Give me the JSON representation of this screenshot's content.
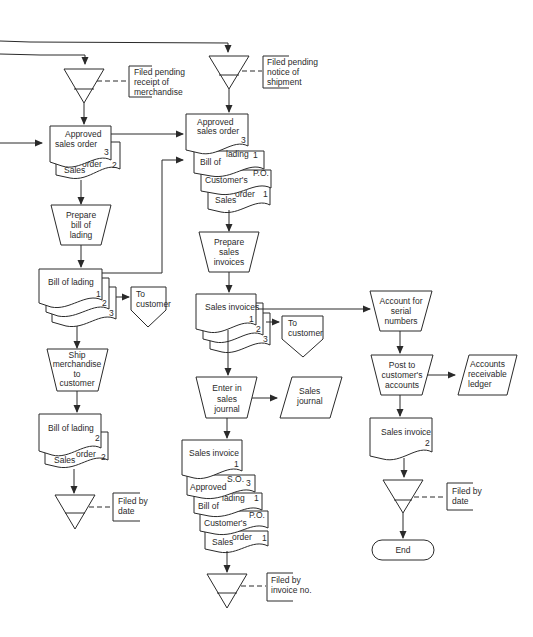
{
  "diagram": {
    "type": "document-flowchart",
    "colors": {
      "line": "#2a2a2a",
      "background": "#ffffff"
    },
    "nodes": {
      "file_pending_merchandise": {
        "shape": "offline-file",
        "annotation": [
          "Filed pending",
          "receipt of",
          "merchandise"
        ]
      },
      "file_pending_shipment": {
        "shape": "offline-file",
        "annotation": [
          "Filed pending",
          "notice of",
          "shipment"
        ]
      },
      "left_doc_stack_1": {
        "shape": "document-stack",
        "pages": [
          {
            "title": [
              "Approved",
              "sales order"
            ],
            "copy": "3"
          },
          {
            "title_a": "Sales",
            "title_b": "order",
            "copy": "2"
          }
        ]
      },
      "prepare_bol": {
        "shape": "manual-operation",
        "label": [
          "Prepare",
          "bill of",
          "lading"
        ]
      },
      "bol_stack": {
        "shape": "document-stack",
        "pages": [
          {
            "title": "Bill of lading",
            "copy": "1"
          },
          {
            "copy": "2"
          },
          {
            "copy": "3"
          }
        ]
      },
      "to_customer_1": {
        "shape": "off-page-connector",
        "label": [
          "To",
          "customer"
        ]
      },
      "ship_merchandise": {
        "shape": "manual-operation",
        "label": [
          "Ship",
          "merchandise",
          "to",
          "customer"
        ]
      },
      "left_doc_stack_2": {
        "shape": "document-stack",
        "pages": [
          {
            "title": "Bill of lading",
            "copy": "2"
          },
          {
            "title_a": "Sales",
            "title_b": "order",
            "copy": "2"
          }
        ]
      },
      "file_by_date_left": {
        "shape": "offline-file",
        "annotation": [
          "Filed by",
          "date"
        ]
      },
      "middle_doc_stack_1": {
        "shape": "document-stack",
        "pages": [
          {
            "title": [
              "Approved",
              "sales order"
            ],
            "copy": "3"
          },
          {
            "title_a": "Bill of",
            "title_b": "lading",
            "copy": "1"
          },
          {
            "title_a": "Customer's",
            "title_b": "P.O.",
            "copy": ""
          },
          {
            "title_a": "Sales",
            "title_b": "order",
            "copy": "1"
          }
        ]
      },
      "prepare_invoices": {
        "shape": "manual-operation",
        "label": [
          "Prepare",
          "sales",
          "invoices"
        ]
      },
      "invoice_stack": {
        "shape": "document-stack",
        "pages": [
          {
            "title": "Sales invoices",
            "copy": "1"
          },
          {
            "copy": "2"
          },
          {
            "copy": "3"
          }
        ]
      },
      "to_customer_2": {
        "shape": "off-page-connector",
        "label": [
          "To",
          "customer"
        ]
      },
      "enter_journal": {
        "shape": "manual-operation",
        "label": [
          "Enter in",
          "sales",
          "journal"
        ]
      },
      "sales_journal": {
        "shape": "parallelogram",
        "label": [
          "Sales",
          "journal"
        ]
      },
      "middle_doc_stack_2": {
        "shape": "document-stack",
        "pages": [
          {
            "title": "Sales invoice",
            "copy": "1"
          },
          {
            "title_a": "Approved",
            "title_b": "S.O.",
            "copy": "3"
          },
          {
            "title_a": "Bill of",
            "title_b": "lading",
            "copy": "1"
          },
          {
            "title_a": "Customer's",
            "title_b": "P.O.",
            "copy": ""
          },
          {
            "title_a": "Sales",
            "title_b": "order",
            "copy": "1"
          }
        ]
      },
      "file_by_invoice": {
        "shape": "offline-file",
        "annotation": [
          "Filed by",
          "invoice no."
        ]
      },
      "account_serial": {
        "shape": "manual-operation",
        "label": [
          "Account for",
          "serial",
          "numbers"
        ]
      },
      "post_accounts": {
        "shape": "manual-operation",
        "label": [
          "Post to",
          "customer's",
          "accounts"
        ]
      },
      "ar_ledger": {
        "shape": "parallelogram",
        "label": [
          "Accounts",
          "receivable",
          "ledger"
        ]
      },
      "right_invoice_doc": {
        "shape": "document",
        "title": "Sales invoice",
        "copy": "2"
      },
      "file_by_date_right": {
        "shape": "offline-file",
        "annotation": [
          "Filed by",
          "date"
        ]
      },
      "end": {
        "shape": "terminal",
        "label": "End"
      }
    }
  }
}
